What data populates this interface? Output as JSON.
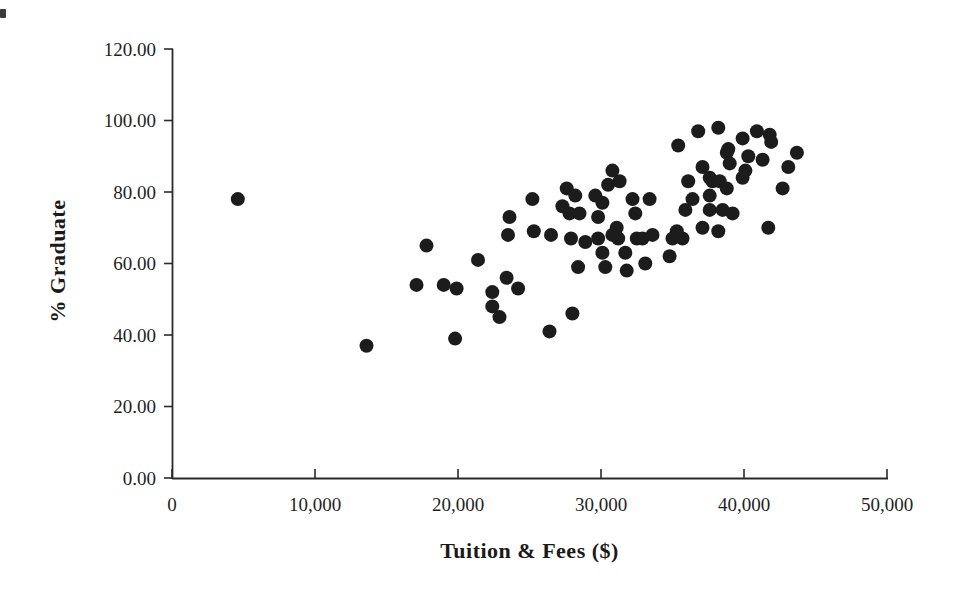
{
  "colors": {
    "background": "#ffffff",
    "axis": "#2a2a2a",
    "marker": "#1c1c1c",
    "text": "#1f1f1f"
  },
  "chart_data": {
    "type": "scatter",
    "title": "",
    "xlabel": "Tuition & Fees ($)",
    "ylabel": "% Graduate",
    "xlim": [
      0,
      50000
    ],
    "ylim": [
      0,
      120
    ],
    "grid": false,
    "legend": "none",
    "x_ticks": [
      0,
      10000,
      20000,
      30000,
      40000,
      50000
    ],
    "x_tick_labels": [
      "0",
      "10,000",
      "20,000",
      "30,000",
      "40,000",
      "50,000"
    ],
    "y_ticks": [
      0,
      20,
      40,
      60,
      80,
      100,
      120
    ],
    "y_tick_labels": [
      "0.00",
      "20.00",
      "40.00",
      "60.00",
      "80.00",
      "100.00",
      "120.00"
    ],
    "marker": {
      "shape": "circle",
      "color": "#1c1c1c",
      "radius_px": 7
    },
    "points": [
      [
        4600,
        78
      ],
      [
        13600,
        37
      ],
      [
        17100,
        54
      ],
      [
        17800,
        65
      ],
      [
        19000,
        54
      ],
      [
        19900,
        53
      ],
      [
        19800,
        39
      ],
      [
        21400,
        61
      ],
      [
        22400,
        52
      ],
      [
        22400,
        48
      ],
      [
        22900,
        45
      ],
      [
        23400,
        56
      ],
      [
        24200,
        53
      ],
      [
        26400,
        41
      ],
      [
        28000,
        46
      ],
      [
        25200,
        78
      ],
      [
        23600,
        73
      ],
      [
        23500,
        68
      ],
      [
        25300,
        69
      ],
      [
        26500,
        68
      ],
      [
        27600,
        81
      ],
      [
        28200,
        79
      ],
      [
        27300,
        76
      ],
      [
        27800,
        74
      ],
      [
        28500,
        74
      ],
      [
        27900,
        67
      ],
      [
        28900,
        66
      ],
      [
        28400,
        59
      ],
      [
        29600,
        79
      ],
      [
        30100,
        77
      ],
      [
        29800,
        73
      ],
      [
        30500,
        82
      ],
      [
        31300,
        83
      ],
      [
        30800,
        86
      ],
      [
        29800,
        67
      ],
      [
        30100,
        63
      ],
      [
        30300,
        59
      ],
      [
        31200,
        67
      ],
      [
        31700,
        63
      ],
      [
        31800,
        58
      ],
      [
        31100,
        70
      ],
      [
        30800,
        68
      ],
      [
        32200,
        78
      ],
      [
        33400,
        78
      ],
      [
        32400,
        74
      ],
      [
        32500,
        67
      ],
      [
        33600,
        68
      ],
      [
        32900,
        67
      ],
      [
        33100,
        60
      ],
      [
        34800,
        62
      ],
      [
        35000,
        67
      ],
      [
        35700,
        67
      ],
      [
        35400,
        93
      ],
      [
        36800,
        97
      ],
      [
        38200,
        98
      ],
      [
        37100,
        87
      ],
      [
        36100,
        83
      ],
      [
        37800,
        83
      ],
      [
        36400,
        78
      ],
      [
        37600,
        79
      ],
      [
        35900,
        75
      ],
      [
        37600,
        75
      ],
      [
        35300,
        69
      ],
      [
        37100,
        70
      ],
      [
        38500,
        75
      ],
      [
        39200,
        74
      ],
      [
        38200,
        69
      ],
      [
        41700,
        70
      ],
      [
        38900,
        92
      ],
      [
        39900,
        95
      ],
      [
        40900,
        97
      ],
      [
        41800,
        96
      ],
      [
        41900,
        94
      ],
      [
        40300,
        90
      ],
      [
        41300,
        89
      ],
      [
        43100,
        87
      ],
      [
        43700,
        91
      ],
      [
        42700,
        81
      ],
      [
        39900,
        84
      ],
      [
        38800,
        91
      ],
      [
        39000,
        88
      ],
      [
        37600,
        84
      ],
      [
        38300,
        83
      ],
      [
        38800,
        81
      ],
      [
        40100,
        86
      ]
    ]
  }
}
